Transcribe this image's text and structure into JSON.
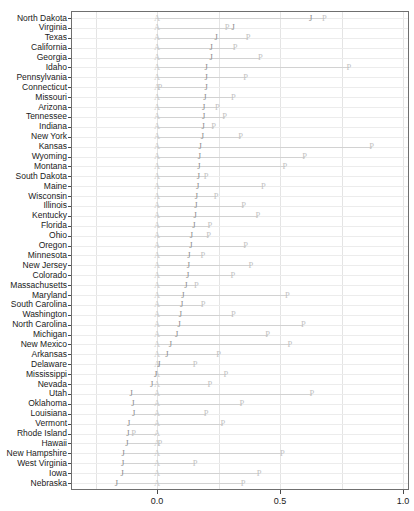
{
  "chart_data": {
    "type": "scatter",
    "title": "",
    "xlabel": "",
    "ylabel": "",
    "xlim": [
      -0.18,
      1.05
    ],
    "xticks": [
      0.0,
      0.5,
      1.0
    ],
    "xticklabels": [
      "0.0",
      "0.5",
      "1.0"
    ],
    "grid": true,
    "legend_position": "none",
    "series": [
      {
        "name": "A",
        "label": "A"
      },
      {
        "name": "J",
        "label": "J"
      },
      {
        "name": "P",
        "label": "P"
      }
    ],
    "categories": [
      "North Dakota",
      "Virginia",
      "Texas",
      "California",
      "Georgia",
      "Idaho",
      "Pennsylvania",
      "Connecticut",
      "Missouri",
      "Arizona",
      "Tennessee",
      "Indiana",
      "New York",
      "Kansas",
      "Wyoming",
      "Montana",
      "South Dakota",
      "Maine",
      "Wisconsin",
      "Illinois",
      "Kentucky",
      "Florida",
      "Ohio",
      "Oregon",
      "Minnesota",
      "New Jersey",
      "Colorado",
      "Massachusetts",
      "Maryland",
      "South Carolina",
      "Washington",
      "North Carolina",
      "Michigan",
      "New Mexico",
      "Arkansas",
      "Delaware",
      "Mississippi",
      "Nevada",
      "Utah",
      "Oklahoma",
      "Louisiana",
      "Vermont",
      "Rhode Island",
      "Hawaii",
      "New Hampshire",
      "West Virginia",
      "Iowa",
      "Nebraska"
    ],
    "rows": [
      {
        "state": "North Dakota",
        "A": 0.0,
        "J": 0.625,
        "P": 0.68
      },
      {
        "state": "Virginia",
        "A": 0.0,
        "J": 0.31,
        "P": 0.285
      },
      {
        "state": "Texas",
        "A": 0.0,
        "J": 0.24,
        "P": 0.37
      },
      {
        "state": "California",
        "A": 0.0,
        "J": 0.22,
        "P": 0.318
      },
      {
        "state": "Georgia",
        "A": 0.0,
        "J": 0.22,
        "P": 0.42
      },
      {
        "state": "Idaho",
        "A": 0.0,
        "J": 0.2,
        "P": 0.78
      },
      {
        "state": "Pennsylvania",
        "A": 0.0,
        "J": 0.2,
        "P": 0.36
      },
      {
        "state": "Connecticut",
        "A": 0.0,
        "J": 0.2,
        "P": 0.012
      },
      {
        "state": "Missouri",
        "A": 0.0,
        "J": 0.195,
        "P": 0.31
      },
      {
        "state": "Arizona",
        "A": 0.0,
        "J": 0.19,
        "P": 0.245
      },
      {
        "state": "Tennessee",
        "A": 0.0,
        "J": 0.19,
        "P": 0.275
      },
      {
        "state": "Indiana",
        "A": 0.0,
        "J": 0.188,
        "P": 0.23
      },
      {
        "state": "New York",
        "A": 0.0,
        "J": 0.185,
        "P": 0.34
      },
      {
        "state": "Kansas",
        "A": 0.0,
        "J": 0.175,
        "P": 0.872
      },
      {
        "state": "Wyoming",
        "A": 0.0,
        "J": 0.172,
        "P": 0.6
      },
      {
        "state": "Montana",
        "A": 0.0,
        "J": 0.17,
        "P": 0.52
      },
      {
        "state": "South Dakota",
        "A": 0.0,
        "J": 0.168,
        "P": 0.2
      },
      {
        "state": "Maine",
        "A": 0.0,
        "J": 0.165,
        "P": 0.432
      },
      {
        "state": "Wisconsin",
        "A": 0.0,
        "J": 0.16,
        "P": 0.24
      },
      {
        "state": "Illinois",
        "A": 0.0,
        "J": 0.158,
        "P": 0.352
      },
      {
        "state": "Kentucky",
        "A": 0.0,
        "J": 0.155,
        "P": 0.41
      },
      {
        "state": "Florida",
        "A": 0.0,
        "J": 0.15,
        "P": 0.215
      },
      {
        "state": "Ohio",
        "A": 0.0,
        "J": 0.14,
        "P": 0.21
      },
      {
        "state": "Oregon",
        "A": 0.0,
        "J": 0.138,
        "P": 0.36
      },
      {
        "state": "Minnesota",
        "A": 0.0,
        "J": 0.13,
        "P": 0.186
      },
      {
        "state": "New Jersey",
        "A": 0.0,
        "J": 0.128,
        "P": 0.382
      },
      {
        "state": "Colorado",
        "A": 0.0,
        "J": 0.125,
        "P": 0.308
      },
      {
        "state": "Massachusetts",
        "A": 0.0,
        "J": 0.118,
        "P": 0.16
      },
      {
        "state": "Maryland",
        "A": 0.0,
        "J": 0.105,
        "P": 0.53
      },
      {
        "state": "South Carolina",
        "A": 0.0,
        "J": 0.1,
        "P": 0.188
      },
      {
        "state": "Washington",
        "A": 0.0,
        "J": 0.095,
        "P": 0.31
      },
      {
        "state": "North Carolina",
        "A": 0.0,
        "J": 0.09,
        "P": 0.595
      },
      {
        "state": "Michigan",
        "A": 0.0,
        "J": 0.08,
        "P": 0.45
      },
      {
        "state": "New Mexico",
        "A": 0.0,
        "J": 0.055,
        "P": 0.54
      },
      {
        "state": "Arkansas",
        "A": 0.0,
        "J": 0.04,
        "P": 0.25
      },
      {
        "state": "Delaware",
        "A": 0.0,
        "J": 0.008,
        "P": 0.155
      },
      {
        "state": "Mississippi",
        "A": 0.0,
        "J": -0.005,
        "P": 0.28
      },
      {
        "state": "Nevada",
        "A": 0.0,
        "J": -0.022,
        "P": 0.215
      },
      {
        "state": "Utah",
        "A": 0.0,
        "J": -0.105,
        "P": 0.63
      },
      {
        "state": "Oklahoma",
        "A": 0.0,
        "J": -0.098,
        "P": 0.345
      },
      {
        "state": "Louisiana",
        "A": 0.0,
        "J": -0.095,
        "P": 0.2
      },
      {
        "state": "Vermont",
        "A": 0.0,
        "J": -0.115,
        "P": 0.268
      },
      {
        "state": "Rhode Island",
        "A": 0.0,
        "J": -0.118,
        "P": -0.095
      },
      {
        "state": "Hawaii",
        "A": 0.0,
        "J": -0.122,
        "P": 0.012
      },
      {
        "state": "New Hampshire",
        "A": 0.0,
        "J": -0.138,
        "P": 0.51
      },
      {
        "state": "West Virginia",
        "A": 0.0,
        "J": -0.14,
        "P": 0.155
      },
      {
        "state": "Iowa",
        "A": 0.0,
        "J": -0.142,
        "P": 0.415
      },
      {
        "state": "Nebraska",
        "A": 0.0,
        "J": -0.165,
        "P": 0.35
      }
    ]
  }
}
